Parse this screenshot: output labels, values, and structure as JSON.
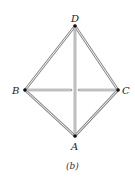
{
  "diagram": {
    "caption": "(b)",
    "vertices": {
      "D": {
        "label": "D",
        "x": 75,
        "y": 26
      },
      "B": {
        "label": "B",
        "x": 25,
        "y": 90
      },
      "C": {
        "label": "C",
        "x": 118,
        "y": 90
      },
      "A": {
        "label": "A",
        "x": 75,
        "y": 136
      }
    },
    "edges": [
      [
        "D",
        "B"
      ],
      [
        "D",
        "C"
      ],
      [
        "D",
        "A"
      ],
      [
        "B",
        "C"
      ],
      [
        "B",
        "A"
      ],
      [
        "C",
        "A"
      ]
    ],
    "colors": {
      "edge": "#888888",
      "vertex": "#111111"
    }
  }
}
